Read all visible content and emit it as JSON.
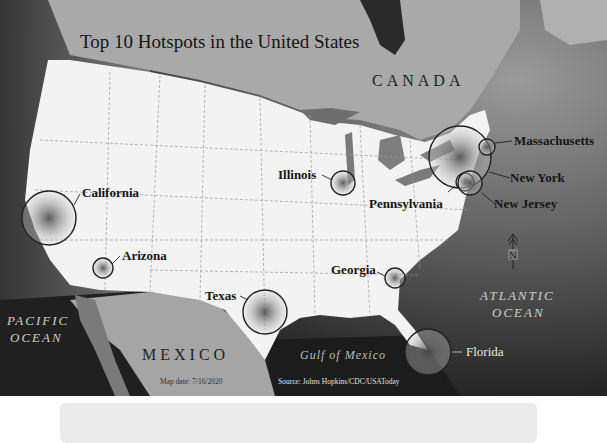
{
  "map": {
    "title": "Top 10 Hotspots in the United States",
    "regions": {
      "canada": "CANADA",
      "mexico": "MEXICO",
      "pacific_line1": "PACIFIC",
      "pacific_line2": "OCEAN",
      "atlantic_line1": "ATLANTIC",
      "atlantic_line2": "OCEAN",
      "gulf": "Gulf of Mexico"
    },
    "hotspots": [
      {
        "state": "California",
        "size": "large"
      },
      {
        "state": "Arizona",
        "size": "small"
      },
      {
        "state": "Texas",
        "size": "large"
      },
      {
        "state": "Illinois",
        "size": "small"
      },
      {
        "state": "Georgia",
        "size": "small"
      },
      {
        "state": "Florida",
        "size": "large"
      },
      {
        "state": "Pennsylvania",
        "size": "small"
      },
      {
        "state": "New York",
        "size": "largest"
      },
      {
        "state": "New Jersey",
        "size": "medium"
      },
      {
        "state": "Massachusetts",
        "size": "small"
      }
    ],
    "north_arrow_label": "N",
    "map_date": "Map date:  7/16/2020",
    "source": "Source: Johns Hopkins/CDC/USAToday"
  },
  "colors": {
    "land_us": "#f2f2f2",
    "land_other": "#a8a8a8",
    "water_dark": "#1c1c1c",
    "water_mid": "#6a6a6a",
    "caption_box": "#ebebeb"
  }
}
